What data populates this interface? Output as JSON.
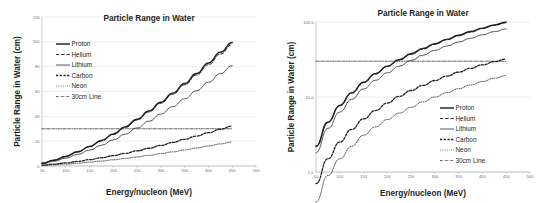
{
  "figure": {
    "panels": [
      "linear-panel",
      "log-panel"
    ]
  },
  "chart_data": [
    {
      "id": "linear",
      "type": "line",
      "title": "Particle Range in Water",
      "xlabel": "Energy/nucleon (MeV)",
      "ylabel": "Particle Range in Water (cm)",
      "yscale": "linear",
      "xlim": [
        50,
        500
      ],
      "ylim": [
        0,
        120
      ],
      "xticks": [
        50,
        100,
        150,
        200,
        250,
        300,
        350,
        400,
        450,
        500
      ],
      "xticklabels": [
        "50",
        "100",
        "150",
        "200",
        "250",
        "300",
        "350",
        "400",
        "450",
        "500"
      ],
      "yticks": [
        0,
        20,
        40,
        60,
        80,
        100,
        120
      ],
      "yticklabels": [
        "0",
        "20",
        "40",
        "60",
        "80",
        "100",
        "120"
      ],
      "grid": "horizontal",
      "legend_position": "upper-left",
      "x": [
        50,
        75,
        100,
        125,
        150,
        175,
        200,
        225,
        250,
        275,
        300,
        325,
        350,
        375,
        400,
        425,
        450
      ],
      "series": [
        {
          "name": "Proton",
          "style": "solid-thick",
          "values": [
            2.2,
            4.6,
            7.7,
            11.4,
            15.7,
            20.5,
            25.8,
            31.5,
            37.7,
            44.3,
            51.3,
            58.7,
            66.4,
            74.5,
            82.9,
            91.6,
            99.5
          ]
        },
        {
          "name": "Helium",
          "style": "dashed",
          "values": [
            2.2,
            4.6,
            7.7,
            11.3,
            15.5,
            20.2,
            25.4,
            31.0,
            37.1,
            43.6,
            50.5,
            57.8,
            65.4,
            73.3,
            81.6,
            90.1,
            97.8
          ]
        },
        {
          "name": "Lithium",
          "style": "solid-thin",
          "values": [
            1.8,
            3.8,
            6.3,
            9.3,
            12.8,
            16.7,
            21.0,
            25.7,
            30.7,
            36.1,
            41.8,
            47.8,
            54.1,
            60.6,
            67.4,
            74.4,
            80.8
          ]
        },
        {
          "name": "Carbon",
          "style": "dashed-thick",
          "values": [
            0.7,
            1.5,
            2.5,
            3.7,
            5.1,
            6.6,
            8.3,
            10.2,
            12.2,
            14.3,
            16.6,
            19.0,
            21.5,
            24.1,
            26.8,
            29.6,
            32.1
          ]
        },
        {
          "name": "Neon",
          "style": "dotted",
          "values": [
            0.4,
            0.9,
            1.5,
            2.2,
            3.1,
            4.0,
            5.0,
            6.1,
            7.3,
            8.6,
            10.0,
            11.4,
            12.9,
            14.5,
            16.1,
            17.8,
            19.3
          ]
        },
        {
          "name": "30cm  Line",
          "style": "dash-dot",
          "constant": 30
        }
      ]
    },
    {
      "id": "log",
      "type": "line",
      "title": "Particle Range in Water",
      "xlabel": "Energy/nucleon (MeV)",
      "ylabel": "Particle Range in Water (cm)",
      "yscale": "log",
      "xlim": [
        50,
        500
      ],
      "ylim": [
        1.0,
        100.0
      ],
      "xticks": [
        50,
        100,
        150,
        200,
        250,
        300,
        350,
        400,
        450,
        500
      ],
      "xticklabels": [
        "50",
        "100",
        "150",
        "200",
        "250",
        "300",
        "350",
        "400",
        "450",
        "500"
      ],
      "yticks": [
        1.0,
        10.0,
        100.0
      ],
      "yticklabels": [
        "1.0",
        "10.0",
        "100.0"
      ],
      "grid": "horizontal",
      "legend_position": "lower-right",
      "x": [
        50,
        75,
        100,
        125,
        150,
        175,
        200,
        225,
        250,
        275,
        300,
        325,
        350,
        375,
        400,
        425,
        450
      ],
      "series": [
        {
          "name": "Proton",
          "style": "solid-thick",
          "values": [
            2.2,
            4.6,
            7.7,
            11.4,
            15.7,
            20.5,
            25.8,
            31.5,
            37.7,
            44.3,
            51.3,
            58.7,
            66.4,
            74.5,
            82.9,
            91.6,
            99.5
          ]
        },
        {
          "name": "Helium",
          "style": "dashed",
          "values": [
            2.2,
            4.6,
            7.7,
            11.3,
            15.5,
            20.2,
            25.4,
            31.0,
            37.1,
            43.6,
            50.5,
            57.8,
            65.4,
            73.3,
            81.6,
            90.1,
            97.8
          ]
        },
        {
          "name": "Lithium",
          "style": "solid-thin",
          "values": [
            1.8,
            3.8,
            6.3,
            9.3,
            12.8,
            16.7,
            21.0,
            25.7,
            30.7,
            36.1,
            41.8,
            47.8,
            54.1,
            60.6,
            67.4,
            74.4,
            80.8
          ]
        },
        {
          "name": "Carbon",
          "style": "dashed-thick",
          "values": [
            0.7,
            1.5,
            2.5,
            3.7,
            5.1,
            6.6,
            8.3,
            10.2,
            12.2,
            14.3,
            16.6,
            19.0,
            21.5,
            24.1,
            26.8,
            29.6,
            32.1
          ]
        },
        {
          "name": "Neon",
          "style": "dotted",
          "values": [
            0.4,
            0.9,
            1.5,
            2.2,
            3.1,
            4.0,
            5.0,
            6.1,
            7.3,
            8.6,
            10.0,
            11.4,
            12.9,
            14.5,
            16.1,
            17.8,
            19.3
          ]
        },
        {
          "name": "30cm  Line",
          "style": "dash-dot",
          "constant": 30
        }
      ]
    }
  ]
}
